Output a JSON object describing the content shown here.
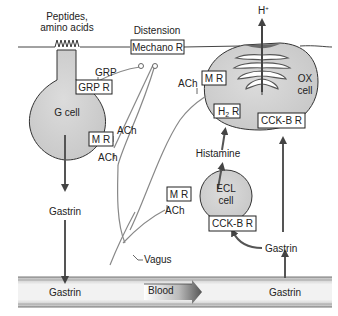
{
  "labels": {
    "peptides_line1": "Peptides,",
    "peptides_line2": "amino acids",
    "distension": "Distension",
    "grp": "GRP",
    "g_cell": "G cell",
    "ach_g_mr": "ACh",
    "ach_g_lower": "ACh",
    "gastrin_mid": "Gastrin",
    "gastrin_blood_left": "Gastrin",
    "blood": "Blood",
    "gastrin_blood_right": "Gastrin",
    "gastrin_ecl": "Gastrin",
    "vagus": "Vagus",
    "ach_ecl": "ACh",
    "ach_ox": "ACh",
    "histamine": "Histamine",
    "ecl_line1": "ECL",
    "ecl_line2": "cell",
    "ox_line1": "OX",
    "ox_line2": "cell",
    "h_plus": "H",
    "h_plus_sup": "+"
  },
  "receptors": {
    "mechano": "Mechano R",
    "grp_r": "GRP R",
    "g_mr": "M R",
    "ox_mr": "M R",
    "h2r_main": "H",
    "h2r_sub": "2",
    "h2r_tail": " R",
    "ox_cckb": "CCK-B R",
    "ecl_mr": "M R",
    "ecl_cckb": "CCK-B R"
  }
}
